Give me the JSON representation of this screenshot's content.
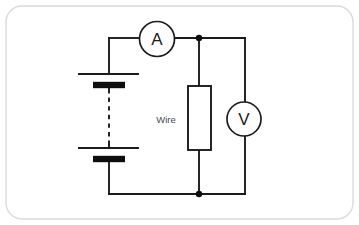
{
  "diagram": {
    "frame": {
      "x": 6,
      "y": 6,
      "width": 347,
      "height": 213,
      "radius": 16,
      "stroke_color": "#d8dadc"
    },
    "colors": {
      "wire": "#1c1c1c",
      "plate_fill": "#0d0d0d",
      "background": "#ffffff",
      "label_text": "#4a4a4a",
      "meter_text": "#1c1c1c",
      "frame": "#d8dadc"
    },
    "components": {
      "battery": {
        "name": "battery",
        "cells": 2,
        "cell_one": {
          "long_plate": {
            "x1": 78,
            "y1": 74,
            "x2": 139,
            "y2": 74
          },
          "short_plate": {
            "x1": 93,
            "y1": 85,
            "x2": 125,
            "y2": 85
          }
        },
        "cell_two": {
          "long_plate": {
            "x1": 78,
            "y1": 148,
            "x2": 139,
            "y2": 148
          },
          "short_plate": {
            "x1": 93,
            "y1": 159,
            "x2": 125,
            "y2": 159
          }
        },
        "dashed_link": {
          "x": 109,
          "y1": 88,
          "y2": 146
        }
      },
      "ammeter": {
        "name": "ammeter",
        "label": "A",
        "cx": 157,
        "cy": 39,
        "r": 17.5
      },
      "voltmeter": {
        "name": "voltmeter",
        "label": "V",
        "cx": 244,
        "cy": 119,
        "r": 17
      },
      "resistor": {
        "name": "wire-resistor",
        "label": "Wire",
        "label_x": 166,
        "label_y": 119,
        "box": {
          "x": 188,
          "y": 86,
          "width": 23,
          "height": 64
        }
      },
      "junctions": [
        {
          "name": "top-junction",
          "cx": 199,
          "cy": 38,
          "r": 3.2
        },
        {
          "name": "bottom-junction",
          "cx": 199,
          "cy": 194,
          "r": 3.2
        }
      ],
      "wires": {
        "top_left_segment": "M 109 38 L 139 38",
        "top_right_segment": "M 175 38 L 245 38",
        "left_stub_top": "M 109 38 L 109 74",
        "left_stub_mid": "M 109 85 L 109 88",
        "left_stub_mid2": "M 109 146 L 109 148",
        "left_stub_bottom": "M 109 159 L 109 194",
        "bottom_segment": "M 109 194 L 245 194",
        "resistor_top_lead": "M 199 38 L 199 86",
        "resistor_bottom_lead": "M 199 150 L 199 194",
        "voltmeter_top_lead": "M 245 38 L 245 102",
        "voltmeter_bottom_lead": "M 245 136 L 245 194"
      }
    }
  }
}
